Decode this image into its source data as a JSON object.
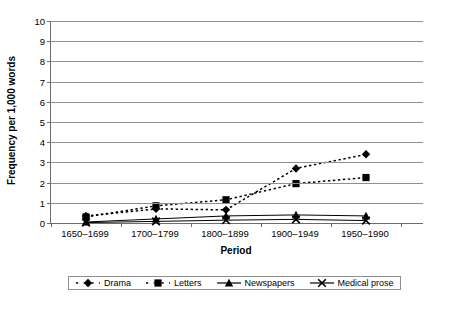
{
  "chart_data": {
    "type": "line",
    "title": "",
    "xlabel": "Period",
    "ylabel": "Frequency per 1,000 words",
    "categories": [
      "1650–1699",
      "1700–1799",
      "1800–1899",
      "1900–1949",
      "1950–1990"
    ],
    "ylim": [
      0,
      10
    ],
    "yticks": [
      "0",
      "1",
      "2",
      "3",
      "4",
      "5",
      "6",
      "7",
      "8",
      "9",
      "10"
    ],
    "ytick_values": [
      0,
      1,
      2,
      3,
      4,
      5,
      6,
      7,
      8,
      9,
      10
    ],
    "grid": true,
    "legend_position": "bottom",
    "series": [
      {
        "name": "Drama",
        "marker": "diamond",
        "linestyle": "dotted",
        "color": "#000000",
        "values": [
          0.35,
          0.7,
          0.65,
          2.7,
          3.4
        ]
      },
      {
        "name": "Letters",
        "marker": "square",
        "linestyle": "dotted",
        "color": "#000000",
        "values": [
          0.3,
          0.85,
          1.15,
          1.95,
          2.25
        ]
      },
      {
        "name": "Newspapers",
        "marker": "triangle",
        "linestyle": "solid",
        "color": "#000000",
        "values": [
          0.05,
          0.2,
          0.35,
          0.4,
          0.35
        ]
      },
      {
        "name": "Medical prose",
        "marker": "x",
        "linestyle": "solid",
        "color": "#000000",
        "values": [
          0.02,
          0.08,
          0.14,
          0.18,
          0.12
        ]
      }
    ]
  }
}
